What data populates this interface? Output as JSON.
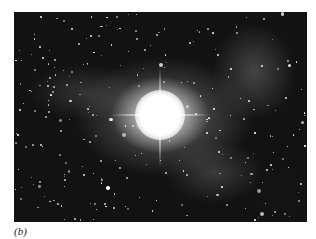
{
  "figure": {
    "caption": "(b)",
    "image": {
      "subject": "astronomical photograph: bright central star with surrounding nebula and dense star field",
      "colors": {
        "background": "#0a0a0a",
        "core": "#ffffff",
        "nebula": "#8a8a8a"
      }
    }
  }
}
